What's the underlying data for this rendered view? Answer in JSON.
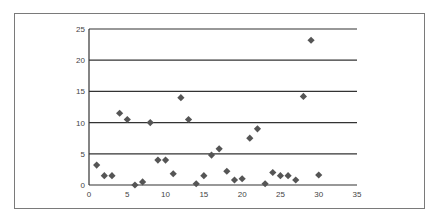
{
  "chart_data": {
    "type": "scatter",
    "title": "",
    "xlabel": "",
    "ylabel": "",
    "xlim": [
      0,
      35
    ],
    "ylim": [
      0,
      25
    ],
    "x_ticks": [
      "0",
      "5",
      "10",
      "15",
      "20",
      "25",
      "30",
      "35"
    ],
    "y_ticks": [
      "0",
      "5",
      "10",
      "15",
      "20",
      "25"
    ],
    "grid": "horizontal",
    "legend": null,
    "marker": "diamond",
    "marker_color": "#555555",
    "series": [
      {
        "name": "",
        "points": [
          {
            "x": 1,
            "y": 3.2
          },
          {
            "x": 2,
            "y": 1.5
          },
          {
            "x": 3,
            "y": 1.5
          },
          {
            "x": 4,
            "y": 11.5
          },
          {
            "x": 5,
            "y": 10.5
          },
          {
            "x": 6,
            "y": 0
          },
          {
            "x": 7,
            "y": 0.5
          },
          {
            "x": 8,
            "y": 10
          },
          {
            "x": 9,
            "y": 4
          },
          {
            "x": 10,
            "y": 4
          },
          {
            "x": 11,
            "y": 1.8
          },
          {
            "x": 12,
            "y": 14
          },
          {
            "x": 13,
            "y": 10.5
          },
          {
            "x": 14,
            "y": 0.2
          },
          {
            "x": 15,
            "y": 1.5
          },
          {
            "x": 16,
            "y": 4.8
          },
          {
            "x": 17,
            "y": 5.8
          },
          {
            "x": 18,
            "y": 2.2
          },
          {
            "x": 19,
            "y": 0.8
          },
          {
            "x": 20,
            "y": 1
          },
          {
            "x": 21,
            "y": 7.5
          },
          {
            "x": 22,
            "y": 9
          },
          {
            "x": 23,
            "y": 0.2
          },
          {
            "x": 24,
            "y": 2
          },
          {
            "x": 25,
            "y": 1.5
          },
          {
            "x": 26,
            "y": 1.5
          },
          {
            "x": 27,
            "y": 0.8
          },
          {
            "x": 28,
            "y": 14.2
          },
          {
            "x": 29,
            "y": 23.2
          },
          {
            "x": 30,
            "y": 1.6
          }
        ]
      }
    ]
  }
}
